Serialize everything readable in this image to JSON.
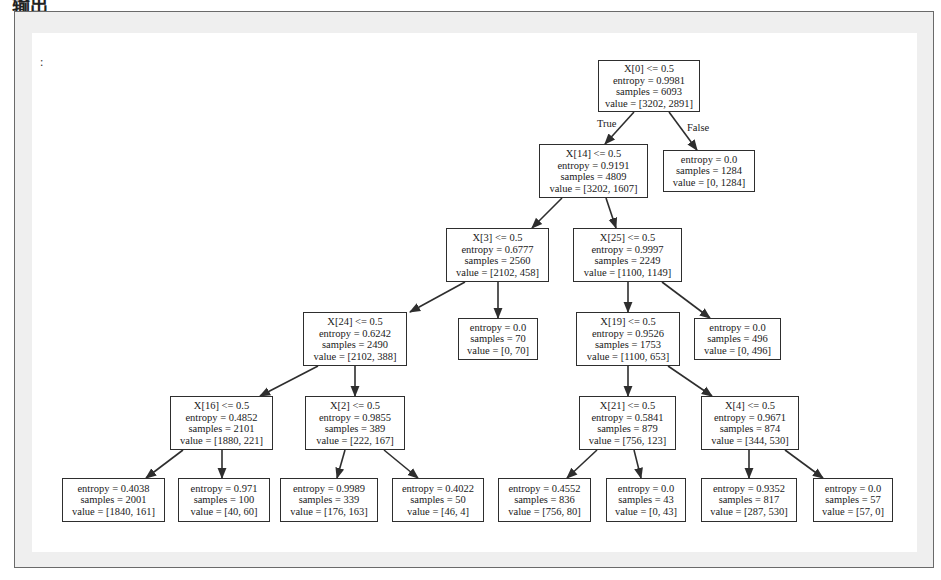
{
  "heading": "输出",
  "prompt_marker": ":",
  "edge_labels": {
    "true": "True",
    "false": "False"
  },
  "nodes": {
    "n0": {
      "split": "X[0] <= 0.5",
      "entropy": "entropy = 0.9981",
      "samples": "samples = 6093",
      "value": "value = [3202, 2891]"
    },
    "n1": {
      "split": "X[14] <= 0.5",
      "entropy": "entropy = 0.9191",
      "samples": "samples = 4809",
      "value": "value = [3202, 1607]"
    },
    "n2": {
      "entropy": "entropy = 0.0",
      "samples": "samples = 1284",
      "value": "value = [0, 1284]"
    },
    "n3": {
      "split": "X[3] <= 0.5",
      "entropy": "entropy = 0.6777",
      "samples": "samples = 2560",
      "value": "value = [2102, 458]"
    },
    "n4": {
      "split": "X[25] <= 0.5",
      "entropy": "entropy = 0.9997",
      "samples": "samples = 2249",
      "value": "value = [1100, 1149]"
    },
    "n5": {
      "split": "X[24] <= 0.5",
      "entropy": "entropy = 0.6242",
      "samples": "samples = 2490",
      "value": "value = [2102, 388]"
    },
    "n6": {
      "entropy": "entropy = 0.0",
      "samples": "samples = 70",
      "value": "value = [0, 70]"
    },
    "n7": {
      "split": "X[19] <= 0.5",
      "entropy": "entropy = 0.9526",
      "samples": "samples = 1753",
      "value": "value = [1100, 653]"
    },
    "n8": {
      "entropy": "entropy = 0.0",
      "samples": "samples = 496",
      "value": "value = [0, 496]"
    },
    "n9": {
      "split": "X[16] <= 0.5",
      "entropy": "entropy = 0.4852",
      "samples": "samples = 2101",
      "value": "value = [1880, 221]"
    },
    "n10": {
      "split": "X[2] <= 0.5",
      "entropy": "entropy = 0.9855",
      "samples": "samples = 389",
      "value": "value = [222, 167]"
    },
    "n11": {
      "split": "X[21] <= 0.5",
      "entropy": "entropy = 0.5841",
      "samples": "samples = 879",
      "value": "value = [756, 123]"
    },
    "n12": {
      "split": "X[4] <= 0.5",
      "entropy": "entropy = 0.9671",
      "samples": "samples = 874",
      "value": "value = [344, 530]"
    },
    "n13": {
      "entropy": "entropy = 0.4038",
      "samples": "samples = 2001",
      "value": "value = [1840, 161]"
    },
    "n14": {
      "entropy": "entropy = 0.971",
      "samples": "samples = 100",
      "value": "value = [40, 60]"
    },
    "n15": {
      "entropy": "entropy = 0.9989",
      "samples": "samples = 339",
      "value": "value = [176, 163]"
    },
    "n16": {
      "entropy": "entropy = 0.4022",
      "samples": "samples = 50",
      "value": "value = [46, 4]"
    },
    "n17": {
      "entropy": "entropy = 0.4552",
      "samples": "samples = 836",
      "value": "value = [756, 80]"
    },
    "n18": {
      "entropy": "entropy = 0.0",
      "samples": "samples = 43",
      "value": "value = [0, 43]"
    },
    "n19": {
      "entropy": "entropy = 0.9352",
      "samples": "samples = 817",
      "value": "value = [287, 530]"
    },
    "n20": {
      "entropy": "entropy = 0.0",
      "samples": "samples = 57",
      "value": "value = [57, 0]"
    }
  },
  "edges": [
    [
      "n0",
      "n1"
    ],
    [
      "n0",
      "n2"
    ],
    [
      "n1",
      "n3"
    ],
    [
      "n1",
      "n4"
    ],
    [
      "n3",
      "n5"
    ],
    [
      "n3",
      "n6"
    ],
    [
      "n4",
      "n7"
    ],
    [
      "n4",
      "n8"
    ],
    [
      "n5",
      "n9"
    ],
    [
      "n5",
      "n10"
    ],
    [
      "n7",
      "n11"
    ],
    [
      "n7",
      "n12"
    ],
    [
      "n9",
      "n13"
    ],
    [
      "n9",
      "n14"
    ],
    [
      "n10",
      "n15"
    ],
    [
      "n10",
      "n16"
    ],
    [
      "n11",
      "n17"
    ],
    [
      "n11",
      "n18"
    ],
    [
      "n12",
      "n19"
    ],
    [
      "n12",
      "n20"
    ]
  ],
  "colors": {
    "line": "#2e2e2e",
    "frame": "#6a6a6a",
    "frame_bg": "#efefef",
    "canvas": "#ffffff"
  }
}
